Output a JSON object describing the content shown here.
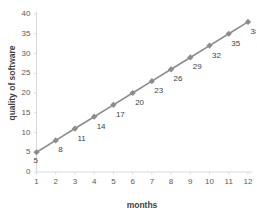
{
  "chart_data": {
    "type": "line",
    "title": "",
    "xlabel": "months",
    "ylabel": "quality of software",
    "x": [
      1,
      2,
      3,
      4,
      5,
      6,
      7,
      8,
      9,
      10,
      11,
      12
    ],
    "categories": [
      "1",
      "2",
      "3",
      "4",
      "5",
      "6",
      "7",
      "8",
      "9",
      "10",
      "11",
      "12"
    ],
    "values": [
      5,
      8,
      11,
      14,
      17,
      20,
      23,
      26,
      29,
      32,
      35,
      38
    ],
    "series": [
      {
        "name": "quality of software",
        "values": [
          5,
          8,
          11,
          14,
          17,
          20,
          23,
          26,
          29,
          32,
          35,
          38
        ]
      }
    ],
    "data_labels": [
      "5",
      "8",
      "11",
      "14",
      "17",
      "20",
      "23",
      "26",
      "29",
      "32",
      "35",
      "38"
    ],
    "data_labels_position": "below-right",
    "xlim": [
      1,
      12
    ],
    "ylim": [
      0,
      40
    ],
    "y_ticks": [
      0,
      5,
      10,
      15,
      20,
      25,
      30,
      35,
      40
    ],
    "y_tick_labels": [
      "0",
      "5",
      "10",
      "15",
      "20",
      "25",
      "30",
      "35",
      "40"
    ],
    "x_ticks": [
      1,
      2,
      3,
      4,
      5,
      6,
      7,
      8,
      9,
      10,
      11,
      12
    ],
    "x_tick_labels": [
      "1",
      "2",
      "3",
      "4",
      "5",
      "6",
      "7",
      "8",
      "9",
      "10",
      "11",
      "12"
    ],
    "grid": false,
    "legend": false,
    "legend_position": "none",
    "marker": "diamond",
    "colors": {
      "line": "#8c8c8c",
      "marker": "#8c8c8c",
      "axis": "#d9d9d9",
      "tick_text": "#5a5a5a",
      "title_text": "#3f3f3f",
      "background": "#ffffff"
    }
  }
}
